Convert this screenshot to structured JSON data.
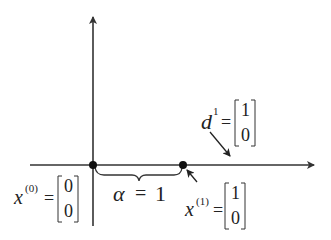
{
  "diagram": {
    "axes": {
      "vertical": {
        "x": 93,
        "y_top": 15,
        "y_bottom": 226
      },
      "horizontal": {
        "y": 165,
        "x_left": 30,
        "x_right": 316
      }
    },
    "points": [
      {
        "id": "x0",
        "cx": 93,
        "cy": 165
      },
      {
        "id": "x1",
        "cx": 183,
        "cy": 165
      }
    ],
    "labels": {
      "x0": {
        "var": "x",
        "sup": "(0)",
        "eq": "=",
        "matrix": [
          "0",
          "0"
        ]
      },
      "x1": {
        "var": "x",
        "sup": "(1)",
        "eq": "=",
        "matrix": [
          "1",
          "0"
        ]
      },
      "d1": {
        "var": "d",
        "sup": "1",
        "eq": "=",
        "matrix": [
          "1",
          "0"
        ]
      },
      "alpha": {
        "symbol": "α",
        "eq": "=",
        "value": "1"
      }
    },
    "colors": {
      "line": "#333333",
      "text": "#222222",
      "point": "#111111"
    }
  }
}
